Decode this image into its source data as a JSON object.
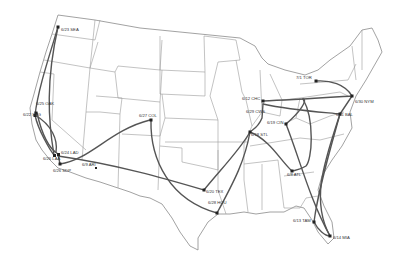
{
  "colors": {
    "route": "#555555",
    "state_border": "#9a9a9a",
    "background": "#ffffff",
    "stop": "#222222"
  },
  "stops": [
    {
      "id": "SEA",
      "label": "6/23 SEA"
    },
    {
      "id": "OAK",
      "label": "6/25 OAK"
    },
    {
      "id": "SFG",
      "label": "6/22 SFG"
    },
    {
      "id": "LAD",
      "label": "6/24 LAD"
    },
    {
      "id": "LAA",
      "label": "6/26 LAA"
    },
    {
      "id": "SDP",
      "label": "6/26 SDP"
    },
    {
      "id": "ARI",
      "label": "6/9 ARI"
    },
    {
      "id": "COL",
      "label": "6/27 COL"
    },
    {
      "id": "TEX",
      "label": "6/20 TEX"
    },
    {
      "id": "HOU",
      "label": "6/28 HOU"
    },
    {
      "id": "STL",
      "label": "6/18 STL"
    },
    {
      "id": "CHC",
      "label": "6/12 CHC"
    },
    {
      "id": "CWS",
      "label": "6/29 CWS"
    },
    {
      "id": "CIN",
      "label": "6/19 CIN"
    },
    {
      "id": "ATL",
      "label": "6/8 ATL"
    },
    {
      "id": "TAM",
      "label": "6/13 TAM"
    },
    {
      "id": "MIA",
      "label": "6/14 MIA"
    },
    {
      "id": "BAL",
      "label": "6/11 BAL"
    },
    {
      "id": "NYM",
      "label": "6/30 NYM"
    },
    {
      "id": "TOR",
      "label": "7/1 TOR"
    }
  ]
}
